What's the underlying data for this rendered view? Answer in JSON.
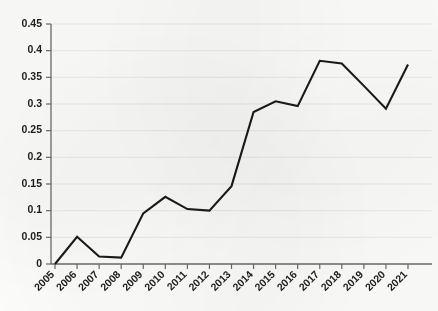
{
  "chart_data": {
    "type": "line",
    "title": "",
    "subtitle": "",
    "xlabel": "",
    "ylabel": "",
    "grid": "horizontal",
    "legend": "none",
    "xlim": [
      2005,
      2021
    ],
    "ylim": [
      0,
      0.45
    ],
    "categories": [
      "2005",
      "2006",
      "2007",
      "2008",
      "2009",
      "2010",
      "2011",
      "2012",
      "2013",
      "2014",
      "2015",
      "2016",
      "2017",
      "2018",
      "2019",
      "2020",
      "2021"
    ],
    "x": [
      2005,
      2006,
      2007,
      2008,
      2009,
      2010,
      2011,
      2012,
      2013,
      2014,
      2015,
      2016,
      2017,
      2018,
      2019,
      2020,
      2021
    ],
    "values": [
      0.0,
      0.051,
      0.014,
      0.012,
      0.095,
      0.126,
      0.103,
      0.1,
      0.146,
      0.285,
      0.305,
      0.296,
      0.381,
      0.376,
      0.334,
      0.291,
      0.374
    ],
    "series": [
      {
        "name": "series-1",
        "color": "#1a1a1a",
        "values": [
          0.0,
          0.051,
          0.014,
          0.012,
          0.095,
          0.126,
          0.103,
          0.1,
          0.146,
          0.285,
          0.305,
          0.296,
          0.381,
          0.376,
          0.334,
          0.291,
          0.374
        ]
      }
    ],
    "ytick_labels": [
      "0",
      "0.05",
      "0.1",
      "0.15",
      "0.2",
      "0.25",
      "0.3",
      "0.35",
      "0.4",
      "0.45"
    ],
    "ytick_values": [
      0,
      0.05,
      0.1,
      0.15,
      0.2,
      0.25,
      0.3,
      0.35,
      0.4,
      0.45
    ],
    "xtick_labels": [
      "2005",
      "2006",
      "2007",
      "2008",
      "2009",
      "2010",
      "2011",
      "2012",
      "2013",
      "2014",
      "2015",
      "2016",
      "2017",
      "2018",
      "2019",
      "2020",
      "2021"
    ],
    "colors": {
      "line": "#1a1a1a",
      "grid": "#e9e9e9",
      "axis": "#6a6a6a",
      "text": "#1d1d1d",
      "background": "#fbfbf9"
    }
  }
}
